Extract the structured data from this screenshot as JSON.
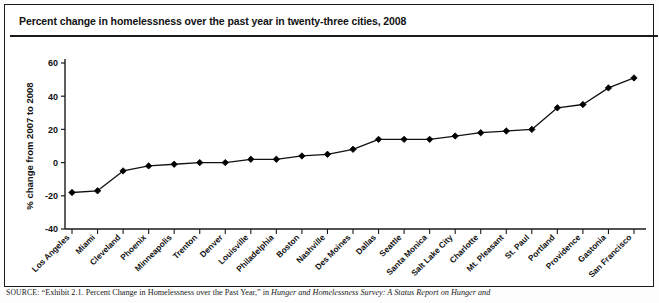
{
  "panel": {
    "title": "Percent change in homelessness over the past year in twenty-three cities, 2008"
  },
  "source": {
    "label": "SOURCE:",
    "text_before_italic": "“Exhibit 2.1. Percent Change in Homelessness over the Past Year,” in ",
    "italic_text": "Hunger and Homelessness Survey: A Status Report on Hunger and"
  },
  "chart_data": {
    "type": "line",
    "title": "Percent change in homelessness over the past year in twenty-three cities, 2008",
    "xlabel": "",
    "ylabel": "% change from 2007 to 2008",
    "ylim": [
      -40,
      60
    ],
    "yticks": [
      -40,
      -20,
      0,
      20,
      40,
      60
    ],
    "ytick_labels": [
      "-40",
      "-20",
      "0",
      "20",
      "40",
      "60"
    ],
    "grid": false,
    "legend": "none",
    "marker": "diamond",
    "categories": [
      "Los Angeles",
      "Miami",
      "Cleveland",
      "Phoenix",
      "Minneapolis",
      "Trenton",
      "Denver",
      "Louisville",
      "Philadelphia",
      "Boston",
      "Nashville",
      "Des Moines",
      "Dallas",
      "Seattle",
      "Santa Monica",
      "Salt Lake City",
      "Charlotte",
      "Mt. Pleasant",
      "St. Paul",
      "Portland",
      "Providence",
      "Gastonia",
      "San Francisco"
    ],
    "values": [
      -18,
      -17,
      -5,
      -2,
      -1,
      0,
      0,
      2,
      2,
      4,
      5,
      8,
      14,
      14,
      14,
      16,
      18,
      19,
      20,
      33,
      35,
      45,
      51
    ],
    "series": [
      {
        "name": "% change from 2007 to 2008",
        "values": [
          -18,
          -17,
          -5,
          -2,
          -1,
          0,
          0,
          2,
          2,
          4,
          5,
          8,
          14,
          14,
          14,
          16,
          18,
          19,
          20,
          33,
          35,
          45,
          51
        ]
      }
    ],
    "colors": {
      "line": "#111111",
      "marker": "#000000",
      "axis": "#1a1a1a",
      "text": "#111111",
      "panel_border": "#1a1a1a",
      "background": "#ffffff"
    }
  }
}
